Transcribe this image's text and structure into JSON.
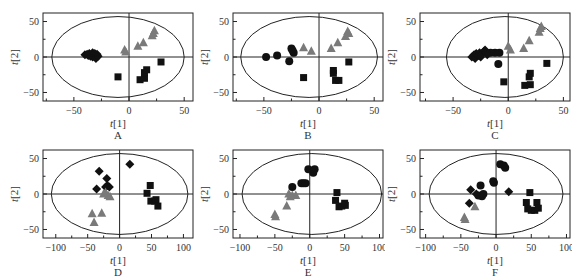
{
  "figure": {
    "colors": {
      "square": "#111111",
      "diamond": "#111111",
      "circle": "#111111",
      "triangle": "#7a7a7a",
      "axis": "#222222"
    },
    "panels": [
      {
        "id": "A",
        "label": "A"
      },
      {
        "id": "B",
        "label": "B"
      },
      {
        "id": "C",
        "label": "C"
      },
      {
        "id": "D",
        "label": "D"
      },
      {
        "id": "E",
        "label": "E"
      },
      {
        "id": "F",
        "label": "F"
      }
    ]
  },
  "chart_data": [
    {
      "type": "scatter",
      "panel": "A",
      "title": "A",
      "xlabel": "t[1]",
      "ylabel": "t[2]",
      "xlim": [
        -78,
        58
      ],
      "ylim": [
        -62,
        62
      ],
      "xticks": [
        -50,
        0,
        50
      ],
      "yticks": [
        -50,
        0,
        50
      ],
      "ellipse": {
        "rx": 60,
        "ry": 57,
        "cx": -10,
        "cy": 0
      },
      "series": [
        {
          "name": "diamond",
          "marker": "diamond",
          "points": [
            [
              -40,
              3
            ],
            [
              -38,
              4
            ],
            [
              -37,
              2
            ],
            [
              -36,
              5
            ],
            [
              -35,
              1
            ],
            [
              -34,
              4
            ],
            [
              -33,
              6
            ],
            [
              -33,
              0
            ],
            [
              -32,
              3
            ],
            [
              -31,
              5
            ],
            [
              -30,
              2
            ],
            [
              -30,
              -2
            ],
            [
              -29,
              4
            ],
            [
              -28,
              1
            ]
          ]
        },
        {
          "name": "triangle",
          "marker": "triangle",
          "points": [
            [
              -4,
              10
            ],
            [
              -3,
              7
            ],
            [
              8,
              15
            ],
            [
              13,
              20
            ],
            [
              21,
              30
            ],
            [
              23,
              37
            ],
            [
              22,
              33
            ]
          ]
        },
        {
          "name": "square",
          "marker": "square",
          "points": [
            [
              -10,
              -28
            ],
            [
              10,
              -32
            ],
            [
              14,
              -30
            ],
            [
              14,
              -22
            ],
            [
              16,
              -18
            ],
            [
              29,
              -7
            ]
          ]
        }
      ]
    },
    {
      "type": "scatter",
      "panel": "B",
      "title": "B",
      "xlabel": "t[1]",
      "ylabel": "t[2]",
      "xlim": [
        -78,
        58
      ],
      "ylim": [
        -62,
        62
      ],
      "xticks": [
        -50,
        0,
        50
      ],
      "yticks": [
        -50,
        0,
        50
      ],
      "ellipse": {
        "rx": 62,
        "ry": 57,
        "cx": -9,
        "cy": 0
      },
      "series": [
        {
          "name": "circle",
          "marker": "circle",
          "points": [
            [
              -48,
              0
            ],
            [
              -38,
              2
            ],
            [
              -27,
              -6
            ],
            [
              -25,
              12
            ],
            [
              -23,
              6
            ],
            [
              -24,
              9
            ]
          ]
        },
        {
          "name": "triangle",
          "marker": "triangle",
          "points": [
            [
              -14,
              13
            ],
            [
              -7,
              8
            ],
            [
              11,
              12
            ],
            [
              17,
              20
            ],
            [
              24,
              29
            ],
            [
              26,
              36
            ],
            [
              27,
              33
            ]
          ]
        },
        {
          "name": "square",
          "marker": "square",
          "points": [
            [
              -14,
              -29
            ],
            [
              13,
              -19
            ],
            [
              13,
              -23
            ],
            [
              15,
              -33
            ],
            [
              18,
              -33
            ],
            [
              27,
              -7
            ]
          ]
        }
      ]
    },
    {
      "type": "scatter",
      "panel": "C",
      "title": "C",
      "xlabel": "t[1]",
      "ylabel": "t[2]",
      "xlim": [
        -80,
        56
      ],
      "ylim": [
        -62,
        62
      ],
      "xticks": [
        -50,
        0,
        50
      ],
      "yticks": [
        -50,
        0,
        50
      ],
      "ellipse": {
        "rx": 53,
        "ry": 57,
        "cx": -3,
        "cy": 0
      },
      "series": [
        {
          "name": "circle",
          "marker": "circle",
          "points": [
            [
              -9,
              -10
            ],
            [
              -8,
              6
            ],
            [
              -12,
              6
            ],
            [
              -16,
              6
            ]
          ]
        },
        {
          "name": "diamond",
          "marker": "diamond",
          "points": [
            [
              -33,
              0
            ],
            [
              -31,
              3
            ],
            [
              -30,
              -2
            ],
            [
              -29,
              5
            ],
            [
              -27,
              2
            ],
            [
              -26,
              6
            ],
            [
              -25,
              0
            ],
            [
              -24,
              4
            ],
            [
              -22,
              8
            ],
            [
              -21,
              10
            ],
            [
              -20,
              6
            ],
            [
              -19,
              3
            ]
          ]
        },
        {
          "name": "triangle",
          "marker": "triangle",
          "points": [
            [
              0,
              15
            ],
            [
              2,
              10
            ],
            [
              14,
              12
            ],
            [
              19,
              23
            ],
            [
              28,
              35
            ],
            [
              30,
              43
            ],
            [
              29,
              40
            ]
          ]
        },
        {
          "name": "square",
          "marker": "square",
          "points": [
            [
              -4,
              -35
            ],
            [
              15,
              -40
            ],
            [
              19,
              -28
            ],
            [
              20,
              -23
            ],
            [
              20,
              -39
            ],
            [
              35,
              -9
            ]
          ]
        }
      ]
    },
    {
      "type": "scatter",
      "panel": "D",
      "title": "D",
      "xlabel": "t[1]",
      "ylabel": "t[2]",
      "xlim": [
        -120,
        115
      ],
      "ylim": [
        -62,
        62
      ],
      "xticks": [
        -100,
        -50,
        0,
        50,
        100
      ],
      "yticks": [
        -50,
        0,
        50
      ],
      "ellipse": {
        "rx": 107,
        "ry": 57,
        "cx": 0,
        "cy": 0
      },
      "series": [
        {
          "name": "diamond",
          "marker": "diamond",
          "points": [
            [
              -36,
              7
            ],
            [
              -32,
              32
            ],
            [
              -20,
              22
            ],
            [
              -19,
              12
            ],
            [
              -16,
              10
            ],
            [
              -22,
              10
            ],
            [
              16,
              42
            ]
          ]
        },
        {
          "name": "triangle",
          "marker": "triangle",
          "points": [
            [
              -25,
              0
            ],
            [
              -22,
              2
            ],
            [
              -18,
              -2
            ],
            [
              -15,
              -4
            ],
            [
              -43,
              -28
            ],
            [
              -40,
              -40
            ],
            [
              -28,
              -27
            ]
          ]
        },
        {
          "name": "square",
          "marker": "square",
          "points": [
            [
              43,
              1
            ],
            [
              48,
              12
            ],
            [
              49,
              -10
            ],
            [
              55,
              -10
            ],
            [
              57,
              -8
            ],
            [
              60,
              -17
            ]
          ]
        }
      ]
    },
    {
      "type": "scatter",
      "panel": "E",
      "title": "E",
      "xlabel": "t[1]",
      "ylabel": "t[2]",
      "xlim": [
        -110,
        105
      ],
      "ylim": [
        -62,
        62
      ],
      "xticks": [
        -100,
        -50,
        0,
        50,
        100
      ],
      "yticks": [
        -50,
        0,
        50
      ],
      "ellipse": {
        "rx": 100,
        "ry": 57,
        "cx": 3,
        "cy": 0
      },
      "series": [
        {
          "name": "circle",
          "marker": "circle",
          "points": [
            [
              -25,
              10
            ],
            [
              -12,
              15
            ],
            [
              -9,
              15
            ],
            [
              -6,
              15
            ],
            [
              -2,
              35
            ],
            [
              5,
              30
            ],
            [
              7,
              35
            ]
          ]
        },
        {
          "name": "triangle",
          "marker": "triangle",
          "points": [
            [
              -30,
              0
            ],
            [
              -28,
              -4
            ],
            [
              -25,
              -2
            ],
            [
              -20,
              -2
            ],
            [
              -33,
              -17
            ],
            [
              -50,
              -29
            ],
            [
              -49,
              -32
            ]
          ]
        },
        {
          "name": "square",
          "marker": "square",
          "points": [
            [
              39,
              2
            ],
            [
              37,
              -9
            ],
            [
              42,
              -18
            ],
            [
              46,
              -17
            ],
            [
              50,
              -13
            ],
            [
              51,
              -16
            ]
          ]
        }
      ]
    },
    {
      "type": "scatter",
      "panel": "F",
      "title": "F",
      "xlabel": "t[1]",
      "ylabel": "t[2]",
      "xlim": [
        -108,
        105
      ],
      "ylim": [
        -62,
        62
      ],
      "xticks": [
        -100,
        -50,
        0,
        50,
        100
      ],
      "yticks": [
        -50,
        0,
        50
      ],
      "ellipse": {
        "rx": 95,
        "ry": 57,
        "cx": 0,
        "cy": 0
      },
      "series": [
        {
          "name": "circle",
          "marker": "circle",
          "points": [
            [
              -22,
              12
            ],
            [
              -25,
              -2
            ],
            [
              -20,
              -3
            ],
            [
              -18,
              0
            ],
            [
              -4,
              18
            ],
            [
              -3,
              16
            ],
            [
              6,
              42
            ],
            [
              11,
              40
            ],
            [
              13,
              37
            ]
          ]
        },
        {
          "name": "diamond",
          "marker": "diamond",
          "points": [
            [
              -36,
              6
            ],
            [
              -38,
              -13
            ],
            [
              -28,
              0
            ],
            [
              18,
              3
            ]
          ]
        },
        {
          "name": "triangle",
          "marker": "triangle",
          "points": [
            [
              -30,
              -18
            ],
            [
              -45,
              -33
            ],
            [
              -44,
              -36
            ]
          ]
        },
        {
          "name": "square",
          "marker": "square",
          "points": [
            [
              48,
              2
            ],
            [
              43,
              -12
            ],
            [
              45,
              -21
            ],
            [
              50,
              -23
            ],
            [
              55,
              -23
            ],
            [
              58,
              -12
            ],
            [
              60,
              -20
            ]
          ]
        }
      ]
    }
  ]
}
